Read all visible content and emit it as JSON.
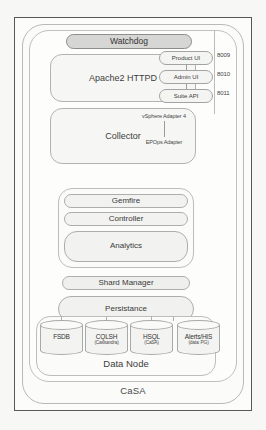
{
  "diagram": {
    "outer_label": "CaSA",
    "watchdog": {
      "label": "Watchdog"
    },
    "web_tier": {
      "label": "Apache2 HTTPD",
      "endpoints": [
        {
          "label": "Product UI",
          "port": "8009"
        },
        {
          "label": "Admin UI",
          "port": "8010"
        },
        {
          "label": "Suite API",
          "port": "8011"
        }
      ]
    },
    "collector": {
      "label": "Collector",
      "adapters": [
        {
          "label": "vSphere Adapter 4"
        },
        {
          "label": "EPOps Adapter"
        }
      ]
    },
    "services": [
      {
        "label": "Gemfire"
      },
      {
        "label": "Controller"
      },
      {
        "label": "Analytics"
      }
    ],
    "shard_manager": {
      "label": "Shard Manager"
    },
    "persistance": {
      "label": "Persistance"
    },
    "data_node": {
      "label": "Data Node",
      "stores": [
        {
          "name": "FSDB",
          "sub": ""
        },
        {
          "name": "CQLSH",
          "sub": "(Cassandra)"
        },
        {
          "name": "HSQL",
          "sub": "(CaSA)"
        },
        {
          "name": "Alerts/HIS",
          "sub": "(data: PG)"
        }
      ]
    }
  }
}
